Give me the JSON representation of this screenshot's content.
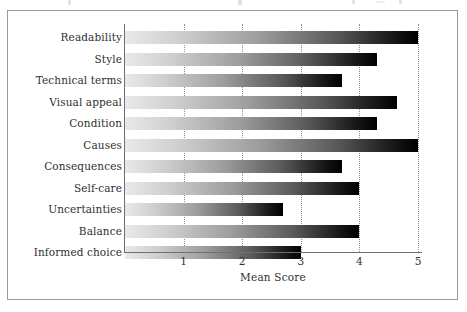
{
  "figure": {
    "frame_color": "#9a9a9a",
    "background": "#ffffff",
    "text_color": "#2f2f2f"
  },
  "chart_data": {
    "type": "bar",
    "orientation": "horizontal",
    "title": "",
    "xlabel": "Mean Score",
    "ylabel": "",
    "xlim": [
      0,
      5
    ],
    "xticks": [
      1,
      2,
      3,
      4,
      5
    ],
    "xtick_labels": [
      "1",
      "2",
      "3",
      "4",
      "5"
    ],
    "grid": "vertical dotted gridlines at each x tick",
    "legend": "none",
    "bar_style": {
      "fill": "horizontal gradient light-grey to black",
      "gradient_start": "#e9e9e9",
      "gradient_end": "#000000",
      "edge": "none"
    },
    "categories": [
      "Readability",
      "Style",
      "Technical terms",
      "Visual appeal",
      "Condition",
      "Causes",
      "Consequences",
      "Self-care",
      "Uncertainties",
      "Balance",
      "Informed choice"
    ],
    "values": [
      5.0,
      4.3,
      3.7,
      4.65,
      4.3,
      5.0,
      3.7,
      4.0,
      2.7,
      4.0,
      3.0
    ]
  }
}
